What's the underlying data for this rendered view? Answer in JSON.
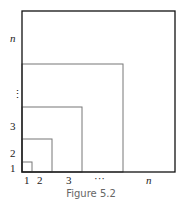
{
  "figure": {
    "caption": "Figure 5.2",
    "y_labels": [
      "1",
      "2",
      "3",
      "⋮",
      "n"
    ],
    "x_labels": [
      "1",
      "2",
      "3",
      "···",
      "n"
    ],
    "squares": [
      {
        "label": "1",
        "size_px": 10
      },
      {
        "label": "2",
        "size_px": 30
      },
      {
        "label": "3",
        "size_px": 60
      },
      {
        "label": "…",
        "size_px": 101
      },
      {
        "label": "n",
        "size_px": 153
      }
    ],
    "colors": {
      "outer": "#111111",
      "inner": "#777777"
    }
  }
}
